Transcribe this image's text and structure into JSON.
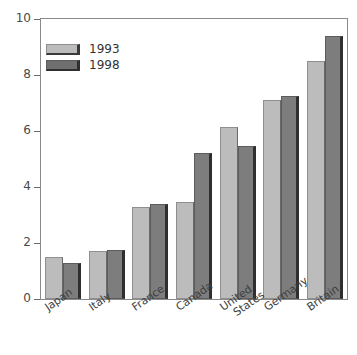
{
  "chart_data": {
    "type": "bar",
    "title": "",
    "xlabel": "",
    "ylabel": "",
    "ylim": [
      0,
      10
    ],
    "yticks": [
      0,
      2,
      4,
      6,
      8,
      10
    ],
    "grid": false,
    "legend_position": "top-left",
    "categories": [
      "Japan",
      "Italy",
      "France",
      "Canada",
      "United States",
      "Germany",
      "Britain"
    ],
    "category_lines": [
      [
        "Japan"
      ],
      [
        "Italy"
      ],
      [
        "France"
      ],
      [
        "Canada"
      ],
      [
        "United",
        "States"
      ],
      [
        "Germany"
      ],
      [
        "Britain"
      ]
    ],
    "series": [
      {
        "name": "1993",
        "color": "#bcbcbc",
        "values": [
          1.5,
          1.7,
          3.3,
          3.45,
          6.15,
          7.1,
          8.5
        ]
      },
      {
        "name": "1998",
        "color": "#7d7d7d",
        "values": [
          1.3,
          1.75,
          3.4,
          5.2,
          5.45,
          7.25,
          9.4
        ]
      }
    ]
  },
  "legend": {
    "items": [
      {
        "label": "1993"
      },
      {
        "label": "1998"
      }
    ]
  },
  "axis": {
    "y_tick_labels": [
      "10",
      "8",
      "6",
      "4",
      "2",
      "0"
    ]
  }
}
